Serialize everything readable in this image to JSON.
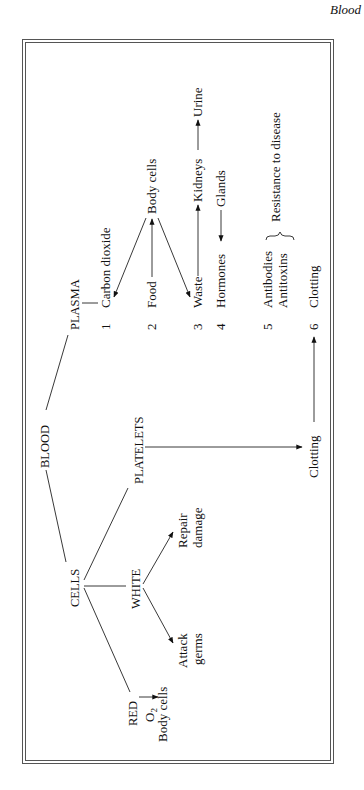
{
  "header": {
    "title": "Blood"
  },
  "diagram": {
    "root": "BLOOD",
    "branches": {
      "plasma": "PLASMA",
      "cells": "CELLS",
      "platelets": "PLATELETS"
    },
    "cells": {
      "red": "RED",
      "white": "WHITE",
      "red_carries": "O",
      "red_carries_sub": "2",
      "red_target": "Body cells",
      "white_repair_1": "Repair",
      "white_repair_2": "damage",
      "white_attack_1": "Attack",
      "white_attack_2": "germs"
    },
    "platelets_function": "Clotting",
    "plasma_items": [
      {
        "num": "1",
        "label": "Carbon dioxide"
      },
      {
        "num": "2",
        "label": "Food"
      },
      {
        "num": "3",
        "label": "Waste"
      },
      {
        "num": "4",
        "label": "Hormones"
      },
      {
        "num": "5",
        "label": "Antibodies",
        "label2": "Antitoxins"
      },
      {
        "num": "6",
        "label": "Clotting"
      }
    ],
    "plasma_targets": {
      "body_cells": "Body cells",
      "kidneys": "Kidneys",
      "urine": "Urine",
      "glands": "Glands",
      "resistance": "Resistance to disease"
    }
  }
}
